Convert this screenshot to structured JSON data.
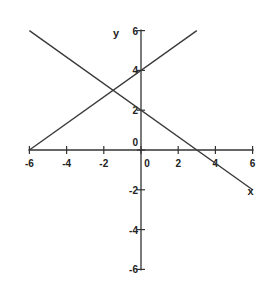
{
  "chart_data": {
    "type": "line",
    "title": "",
    "xlabel": "x",
    "ylabel": "y",
    "xlim": [
      -6,
      6
    ],
    "ylim": [
      -6,
      6
    ],
    "grid": false,
    "legend": "none",
    "x_ticks": [
      -6,
      -4,
      -2,
      0,
      2,
      4,
      6
    ],
    "y_ticks": [
      -6,
      -4,
      -2,
      0,
      2,
      4,
      6
    ],
    "x_tick_labels": [
      "-6",
      "-4",
      "-2",
      "0",
      "2",
      "4",
      "6"
    ],
    "y_tick_labels": [
      "-6",
      "-4",
      "-2",
      "0",
      "2",
      "4",
      "6"
    ],
    "series": [
      {
        "name": "increasing-line",
        "equation": "y = (2/3)x + 4",
        "points": [
          [
            -6,
            0
          ],
          [
            3,
            6
          ]
        ]
      },
      {
        "name": "decreasing-line",
        "equation": "y = -(2/3)x + 2",
        "points": [
          [
            -6,
            6
          ],
          [
            6,
            -2
          ]
        ]
      }
    ]
  }
}
